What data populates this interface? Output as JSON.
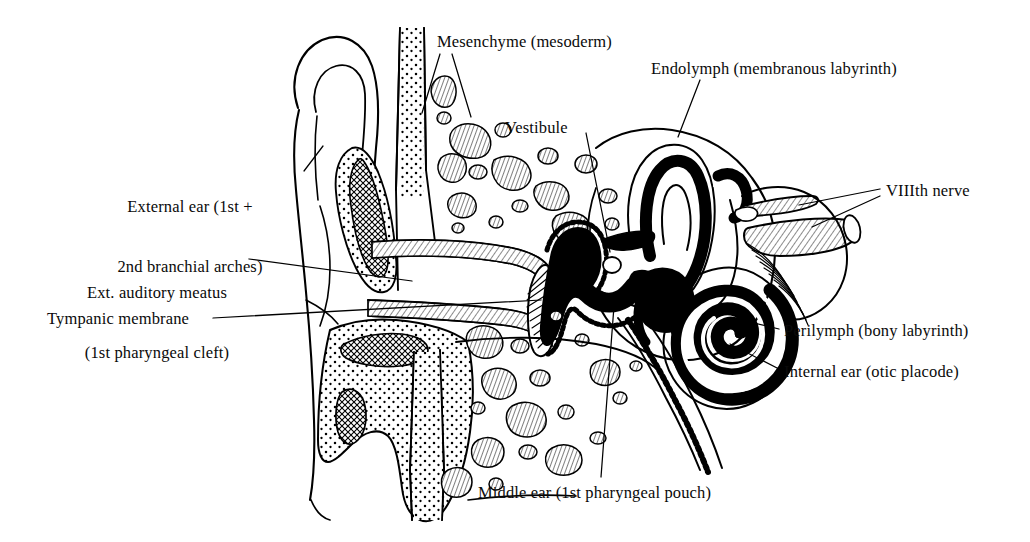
{
  "figure": {
    "domain": "diagram",
    "style": "black-and-white line drawing, pen-and-ink, stippled and hatched shading",
    "background_color": "#ffffff",
    "ink_color": "#000000"
  },
  "labels": {
    "external_ear": {
      "line1": "External ear (1st +",
      "line2": "2nd branchial arches)",
      "x": 90,
      "y": 158,
      "align": "left",
      "leader": [
        [
          305,
          170
        ],
        [
          322,
          146
        ]
      ]
    },
    "mesenchyme": {
      "line1": "Mesenchyme (mesoderm)",
      "x": 437,
      "y": 33,
      "align": "left",
      "leader_a": [
        [
          440,
          55
        ],
        [
          423,
          113
        ]
      ],
      "leader_b": [
        [
          452,
          55
        ],
        [
          470,
          116
        ]
      ]
    },
    "endolymph": {
      "line1": "Endolymph (membranous labyrinth)",
      "x": 651,
      "y": 60,
      "align": "left",
      "leader": [
        [
          700,
          80
        ],
        [
          678,
          136
        ]
      ]
    },
    "vestibule": {
      "line1": "Vestibule",
      "x": 505,
      "y": 118,
      "align": "left",
      "leader": [
        [
          586,
          134
        ],
        [
          608,
          250
        ]
      ]
    },
    "viiith_nerve": {
      "line1": "VIIIth nerve",
      "x": 886,
      "y": 182,
      "align": "left",
      "leader_a": [
        [
          880,
          190
        ],
        [
          800,
          205
        ]
      ],
      "leader_b": [
        [
          880,
          196
        ],
        [
          812,
          226
        ]
      ]
    },
    "ext_auditory_meatus": {
      "line1": "Ext. auditory meatus",
      "line2": "(1st pharyngeal cleft)",
      "x": 80,
      "y": 244,
      "align": "left",
      "leader": [
        [
          248,
          259
        ],
        [
          412,
          281
        ]
      ]
    },
    "tympanic_membrane": {
      "line1": "Tympanic membrane",
      "x": 47,
      "y": 310,
      "align": "left",
      "leader": [
        [
          212,
          318
        ],
        [
          540,
          300
        ]
      ]
    },
    "perilymph": {
      "line1": "Perilymph (bony labyrinth)",
      "x": 784,
      "y": 322,
      "align": "left",
      "leader": [
        [
          780,
          330
        ],
        [
          737,
          320
        ]
      ]
    },
    "internal_ear": {
      "line1": "Internal ear (otic placode)",
      "x": 784,
      "y": 363,
      "align": "left",
      "leader": [
        [
          780,
          370
        ],
        [
          731,
          344
        ]
      ]
    },
    "middle_ear": {
      "line1": "Middle ear (1st pharyngeal pouch)",
      "x": 478,
      "y": 484,
      "align": "left",
      "leader": [
        [
          600,
          478
        ],
        [
          613,
          305
        ]
      ]
    }
  }
}
